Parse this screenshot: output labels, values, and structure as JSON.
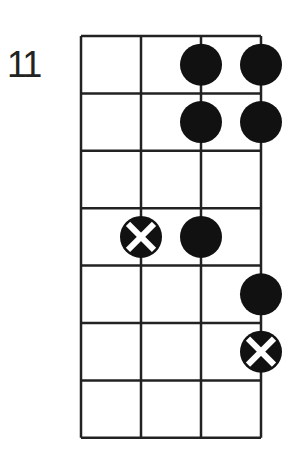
{
  "diagram": {
    "start_fret_label": "11",
    "strings": 4,
    "frets": 7,
    "colors": {
      "line": "#222222",
      "dot": "#111111",
      "x_mark": "#ffffff",
      "background": "#ffffff"
    },
    "markers": [
      {
        "fret": 1,
        "string": 3,
        "type": "dot"
      },
      {
        "fret": 1,
        "string": 4,
        "type": "dot"
      },
      {
        "fret": 2,
        "string": 3,
        "type": "dot"
      },
      {
        "fret": 2,
        "string": 4,
        "type": "dot"
      },
      {
        "fret": 4,
        "string": 2,
        "type": "root-x"
      },
      {
        "fret": 4,
        "string": 3,
        "type": "dot"
      },
      {
        "fret": 5,
        "string": 4,
        "type": "dot"
      },
      {
        "fret": 6,
        "string": 4,
        "type": "root-x"
      }
    ]
  }
}
